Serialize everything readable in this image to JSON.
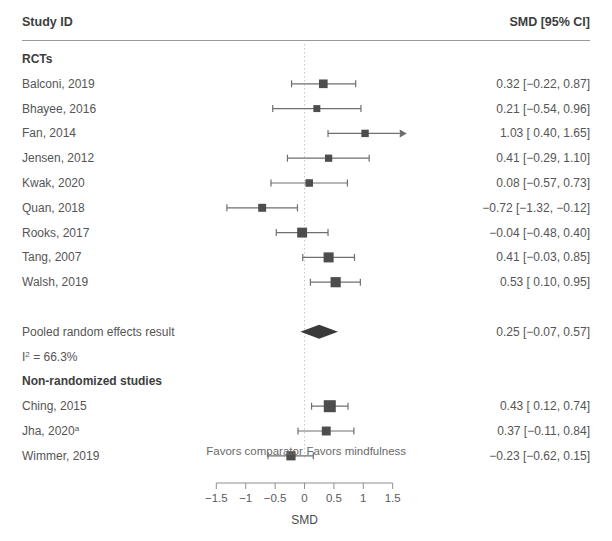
{
  "header": {
    "left_label": "Study ID",
    "right_label": "SMD [95% CI]"
  },
  "axis": {
    "title": "SMD",
    "ticks": [
      -1.5,
      -1,
      -0.5,
      0,
      0.5,
      1,
      1.5
    ],
    "tick_labels": [
      "−1.5",
      "−1",
      "−0.5",
      "0",
      "0.5",
      "1",
      "1.5"
    ],
    "xlim": [
      -1.7,
      1.7
    ],
    "reference_line": 0,
    "favors_left": "Favors comparator",
    "favors_right": "Favors mindfulness"
  },
  "heterogeneity": {
    "label": "I",
    "superscript": "2",
    "value": " = 66.3%",
    "full": "I² = 66.3%"
  },
  "colors": {
    "marker": "#4d4d4d",
    "diamond": "#3a3a3a",
    "line": "#6f6f6f",
    "rule": "#9a9a9a",
    "refline": "#c8c8c8",
    "text": "#555555",
    "heading": "#3d3d3d"
  },
  "chart_data": {
    "type": "forest",
    "title": "",
    "xlabel": "SMD",
    "ylabel": "",
    "xlim": [
      -1.7,
      1.7
    ],
    "grid": false,
    "effect_measure": "SMD",
    "ci_level": "95%",
    "rows": [
      {
        "kind": "group",
        "label": "RCTs"
      },
      {
        "kind": "study",
        "label": "Balconi, 2019",
        "est": 0.32,
        "lo": -0.22,
        "hi": 0.87,
        "value_text": "0.32 [−0.22, 0.87]",
        "weight": 0.52,
        "arrow_right": false
      },
      {
        "kind": "study",
        "label": "Bhayee, 2016",
        "est": 0.21,
        "lo": -0.54,
        "hi": 0.96,
        "value_text": "0.21 [−0.54, 0.96]",
        "weight": 0.28,
        "arrow_right": false
      },
      {
        "kind": "study",
        "label": "Fan, 2014",
        "est": 1.03,
        "lo": 0.4,
        "hi": 1.65,
        "value_text": "1.03 [ 0.40, 1.65]",
        "weight": 0.34,
        "arrow_right": true
      },
      {
        "kind": "study",
        "label": "Jensen, 2012",
        "est": 0.41,
        "lo": -0.29,
        "hi": 1.1,
        "value_text": "0.41 [−0.29, 1.10]",
        "weight": 0.32,
        "arrow_right": false
      },
      {
        "kind": "study",
        "label": "Kwak, 2020",
        "est": 0.08,
        "lo": -0.57,
        "hi": 0.73,
        "value_text": "0.08 [−0.57, 0.73]",
        "weight": 0.36,
        "arrow_right": false
      },
      {
        "kind": "study",
        "label": "Quan, 2018",
        "est": -0.72,
        "lo": -1.32,
        "hi": -0.12,
        "value_text": "−0.72 [−1.32, −0.12]",
        "weight": 0.42,
        "arrow_right": false
      },
      {
        "kind": "study",
        "label": "Rooks, 2017",
        "est": -0.04,
        "lo": -0.48,
        "hi": 0.4,
        "value_text": "−0.04 [−0.48, 0.40]",
        "weight": 0.7,
        "arrow_right": false
      },
      {
        "kind": "study",
        "label": "Tang, 2007",
        "est": 0.41,
        "lo": -0.03,
        "hi": 0.85,
        "value_text": "0.41 [−0.03, 0.85]",
        "weight": 0.72,
        "arrow_right": false
      },
      {
        "kind": "study",
        "label": "Walsh, 2019",
        "est": 0.53,
        "lo": 0.1,
        "hi": 0.95,
        "value_text": "0.53 [ 0.10, 0.95]",
        "weight": 0.74,
        "arrow_right": false
      },
      {
        "kind": "spacer"
      },
      {
        "kind": "pooled",
        "label": "Pooled random effects result",
        "est": 0.25,
        "lo": -0.07,
        "hi": 0.57,
        "value_text": "0.25 [−0.07, 0.57]"
      },
      {
        "kind": "heterogeneity"
      },
      {
        "kind": "group",
        "label": "Non-randomized studies"
      },
      {
        "kind": "study",
        "label": "Ching, 2015",
        "est": 0.43,
        "lo": 0.12,
        "hi": 0.74,
        "value_text": "0.43 [ 0.12, 0.74]",
        "weight": 1.0,
        "arrow_right": false
      },
      {
        "kind": "study",
        "label": "Jha, 2020",
        "superscript": "a",
        "est": 0.37,
        "lo": -0.11,
        "hi": 0.84,
        "value_text": "0.37 [−0.11, 0.84]",
        "weight": 0.56,
        "arrow_right": false
      },
      {
        "kind": "study",
        "label": "Wimmer, 2019",
        "est": -0.23,
        "lo": -0.62,
        "hi": 0.15,
        "value_text": "−0.23 [−0.62, 0.15]",
        "weight": 0.6,
        "arrow_right": false
      }
    ]
  }
}
